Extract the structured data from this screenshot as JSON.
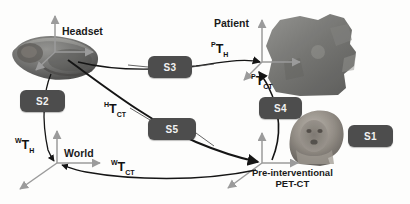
{
  "figure": {
    "type": "coordinate-frame-transformation-diagram",
    "background_color": "#fdfdfc",
    "badge_color": "#4d4d4d",
    "badge_text_color": "#f2f2f2",
    "axis_color": "#9b9b9b",
    "arrow_color": "#1a1a1a"
  },
  "frames": [
    {
      "id": "headset",
      "label": "Headset",
      "origin": [
        55,
        52
      ]
    },
    {
      "id": "patient",
      "label": "Patient",
      "origin": [
        262,
        62
      ]
    },
    {
      "id": "world",
      "label": "World",
      "origin": [
        57,
        163
      ]
    },
    {
      "id": "petct",
      "label": "Pre-interventional PET-CT",
      "origin": [
        262,
        163
      ]
    }
  ],
  "labels": {
    "headset": "Headset",
    "patient": "Patient",
    "world": "World",
    "petct_line1": "Pre-interventional",
    "petct_line2": "PET-CT"
  },
  "transforms": [
    {
      "id": "p_t_h",
      "pre": "P",
      "base": "T",
      "sub": "H",
      "text": "PTH"
    },
    {
      "id": "p_t_ct",
      "pre": "P",
      "base": "T",
      "sub": "CT",
      "text": "PTCT"
    },
    {
      "id": "h_t_ct",
      "pre": "H",
      "base": "T",
      "sub": "CT",
      "text": "HTCT"
    },
    {
      "id": "w_t_h",
      "pre": "W",
      "base": "T",
      "sub": "H",
      "text": "WTH"
    },
    {
      "id": "w_t_ct",
      "pre": "W",
      "base": "T",
      "sub": "CT",
      "text": "WTCT"
    }
  ],
  "badges": [
    {
      "id": "s1",
      "label": "S1",
      "x": 348,
      "y": 125,
      "w": 45,
      "h": 22
    },
    {
      "id": "s2",
      "label": "S2",
      "x": 20,
      "y": 90,
      "w": 45,
      "h": 22
    },
    {
      "id": "s3",
      "label": "S3",
      "x": 148,
      "y": 56,
      "w": 44,
      "h": 22
    },
    {
      "id": "s4",
      "label": "S4",
      "x": 259,
      "y": 97,
      "w": 43,
      "h": 22
    },
    {
      "id": "s5",
      "label": "S5",
      "x": 148,
      "y": 118,
      "w": 48,
      "h": 22
    }
  ],
  "photos": [
    {
      "id": "headset-photo",
      "alt": "ar-headset"
    },
    {
      "id": "patient-photo",
      "alt": "patient-torso"
    },
    {
      "id": "petct-photo",
      "alt": "pet-ct-head-volume"
    }
  ]
}
